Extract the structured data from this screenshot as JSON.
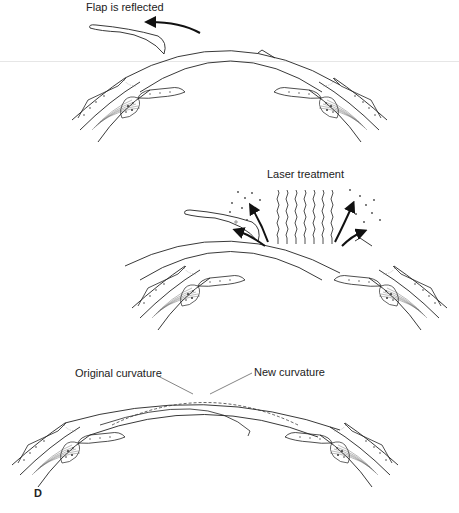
{
  "figure": {
    "panel_letter": "D",
    "stages": [
      {
        "id": "flap",
        "label": "Flap is reflected"
      },
      {
        "id": "laser",
        "label": "Laser treatment"
      },
      {
        "id": "result",
        "labels": {
          "original": "Original curvature",
          "new": "New curvature"
        }
      }
    ]
  },
  "colors": {
    "line": "#222222",
    "fill": "#ffffff",
    "dotted": "#999999",
    "scanline": "#e6e6e6"
  }
}
